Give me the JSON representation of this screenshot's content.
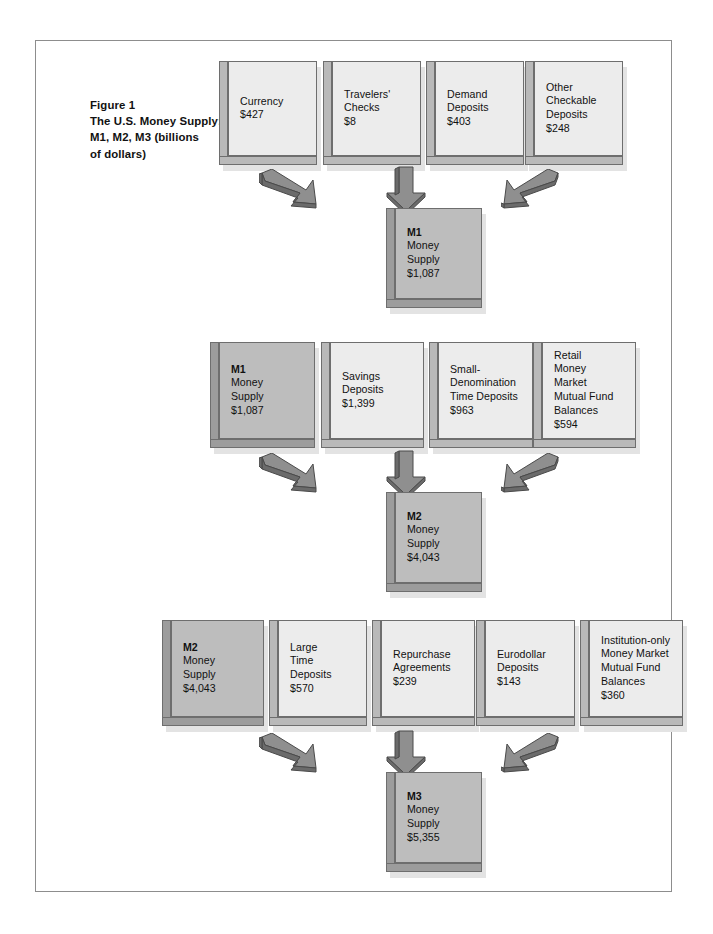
{
  "figure": {
    "title_lines": [
      "Figure 1",
      "The U.S. Money Supply:",
      "M1, M2, M3 (billions",
      "of dollars)"
    ]
  },
  "colors": {
    "box_face": "#ececec",
    "box_face_dark": "#bdbdbd",
    "box_side": "#b9b9b9",
    "box_side_dark": "#9c9c9c",
    "box_outline": "#6e6e6e",
    "shadow": "#e3e3e3",
    "arrow_light": "#8f8f8f",
    "arrow_dark": "#6b6b6b",
    "frame": "#8d8d8d",
    "text": "#111111"
  },
  "rows": [
    {
      "id": "m1",
      "components": [
        {
          "lines": [
            "Currency",
            "$427"
          ],
          "bold_first": false,
          "dark": false
        },
        {
          "lines": [
            "Travelers'",
            "Checks",
            "$8"
          ],
          "bold_first": false,
          "dark": false
        },
        {
          "lines": [
            "Demand",
            "Deposits",
            "$403"
          ],
          "bold_first": false,
          "dark": false
        },
        {
          "lines": [
            "Other",
            "Checkable",
            "Deposits",
            "$248"
          ],
          "bold_first": false,
          "dark": false
        }
      ],
      "result": {
        "lines": [
          "M1",
          "Money",
          "Supply",
          "$1,087"
        ],
        "bold_first": true,
        "dark": true
      },
      "arrows": [
        "down-right",
        "down",
        "down-left"
      ]
    },
    {
      "id": "m2",
      "components": [
        {
          "lines": [
            "M1",
            "Money",
            "Supply",
            "$1,087"
          ],
          "bold_first": true,
          "dark": true
        },
        {
          "lines": [
            "Savings",
            "Deposits",
            "$1,399"
          ],
          "bold_first": false,
          "dark": false
        },
        {
          "lines": [
            "Small-",
            "Denomination",
            "Time Deposits",
            "$963"
          ],
          "bold_first": false,
          "dark": false
        },
        {
          "lines": [
            "Retail",
            "Money",
            "Market",
            "Mutual Fund",
            "Balances",
            "$594"
          ],
          "bold_first": false,
          "dark": false
        }
      ],
      "result": {
        "lines": [
          "M2",
          "Money",
          "Supply",
          "$4,043"
        ],
        "bold_first": true,
        "dark": true
      },
      "arrows": [
        "down-right",
        "down",
        "down-left"
      ]
    },
    {
      "id": "m3",
      "components": [
        {
          "lines": [
            "M2",
            "Money",
            "Supply",
            "$4,043"
          ],
          "bold_first": true,
          "dark": true
        },
        {
          "lines": [
            "Large",
            "Time",
            "Deposits",
            "$570"
          ],
          "bold_first": false,
          "dark": false
        },
        {
          "lines": [
            "Repurchase",
            "Agreements",
            "$239"
          ],
          "bold_first": false,
          "dark": false
        },
        {
          "lines": [
            "Eurodollar",
            "Deposits",
            "$143"
          ],
          "bold_first": false,
          "dark": false
        },
        {
          "lines": [
            "Institution-only",
            "Money Market",
            "Mutual Fund",
            "Balances",
            "$360"
          ],
          "bold_first": false,
          "dark": false
        }
      ],
      "result": {
        "lines": [
          "M3",
          "Money",
          "Supply",
          "$5,355"
        ],
        "bold_first": true,
        "dark": true
      },
      "arrows": [
        "down-right",
        "down",
        "down-left"
      ]
    }
  ],
  "layout": {
    "rows": [
      {
        "y": 60,
        "h": 104,
        "boxes": [
          {
            "x": 218,
            "w": 98
          },
          {
            "x": 322,
            "w": 98
          },
          {
            "x": 425,
            "w": 98
          },
          {
            "x": 524,
            "w": 98
          }
        ],
        "arrow_y": 168,
        "arrows_x": [
          258,
          382,
          500
        ],
        "result": {
          "x": 385,
          "y": 207,
          "w": 96,
          "h": 100
        }
      },
      {
        "y": 341,
        "h": 106,
        "boxes": [
          {
            "x": 209,
            "w": 105
          },
          {
            "x": 320,
            "w": 103
          },
          {
            "x": 428,
            "w": 104
          },
          {
            "x": 532,
            "w": 103
          }
        ],
        "arrow_y": 452,
        "arrow_x": [
          258,
          382,
          500
        ],
        "result": {
          "x": 385,
          "y": 491,
          "w": 96,
          "h": 100
        }
      },
      {
        "y": 619,
        "h": 106,
        "boxes": [
          {
            "x": 161,
            "w": 102
          },
          {
            "x": 268,
            "w": 98
          },
          {
            "x": 371,
            "w": 103
          },
          {
            "x": 475,
            "w": 99
          },
          {
            "x": 579,
            "w": 103
          }
        ],
        "arrow_y": 732,
        "arrow_x": [
          258,
          382,
          500
        ],
        "result": {
          "x": 385,
          "y": 771,
          "w": 96,
          "h": 100
        }
      }
    ]
  }
}
